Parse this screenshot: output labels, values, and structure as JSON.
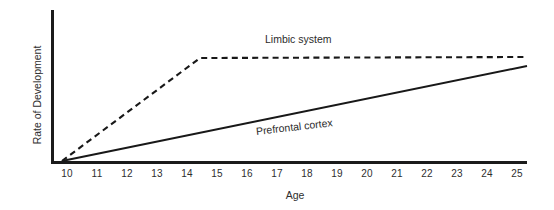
{
  "chart_data": {
    "type": "line",
    "title": "",
    "xlabel": "Age",
    "ylabel": "Rate of Development",
    "x_tick_labels": [
      "10",
      "11",
      "12",
      "13",
      "14",
      "15",
      "16",
      "17",
      "18",
      "19",
      "20",
      "21",
      "22",
      "23",
      "24",
      "25"
    ],
    "xlim": [
      10,
      25
    ],
    "ylim": [
      0,
      1
    ],
    "y_tick_labels": [],
    "grid": false,
    "legend_position": "inline-annotations",
    "axis_color": "#1b1b1b",
    "background_color": "#ffffff",
    "series": [
      {
        "name": "Limbic system",
        "style": "dashed",
        "color": "#181818",
        "annotation": "Limbic system",
        "x": [
          10,
          14.6,
          25
        ],
        "values": [
          0.0,
          0.68,
          0.69
        ],
        "description": "Rises steeply from age 10 to about age 14.6, then plateaus flat through age 25"
      },
      {
        "name": "Prefrontal cortex",
        "style": "solid",
        "color": "#181818",
        "annotation": "Prefrontal cortex",
        "x": [
          10,
          25
        ],
        "values": [
          0.0,
          0.63
        ],
        "description": "Rises steadily and linearly from age 10 through age 25"
      }
    ]
  },
  "geometry": {
    "y_axis_x": 51,
    "x_axis_y": 163,
    "plot_left": 62,
    "plot_right": 527,
    "plot_top": 10,
    "tick_start_x": 67,
    "tick_spacing": 30,
    "tick_label_y": 169,
    "paths": {
      "dashed": "M 62 161 L 200 58 L 527 57",
      "solid": "M 62 161 L 527 66",
      "y_axis": "M 52 10 L 52 163",
      "x_axis": "M 51 162.5 L 527 162.5"
    }
  }
}
